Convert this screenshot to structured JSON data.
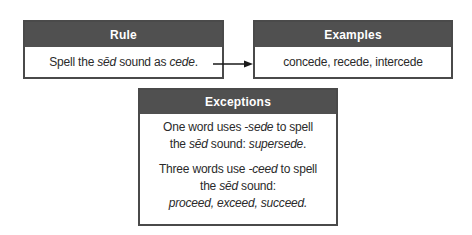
{
  "rule": {
    "title": "Rule",
    "text_pre": "Spell the ",
    "text_sound": "sēd",
    "text_mid": " sound as ",
    "text_word": "cede",
    "text_post": "."
  },
  "examples": {
    "title": "Examples",
    "text": "concede, recede, intercede"
  },
  "exceptions": {
    "title": "Exceptions",
    "p1": {
      "line1_pre": "One word uses ",
      "line1_suffix": "-sede",
      "line1_post": " to spell",
      "line2_pre": "the ",
      "line2_sound": "sēd",
      "line2_mid": " sound: ",
      "line2_word": "supersede",
      "line2_post": "."
    },
    "p2": {
      "line1_pre": "Three words use ",
      "line1_suffix": "-ceed",
      "line1_post": " to spell",
      "line2_pre": "the ",
      "line2_sound": "sēd",
      "line2_post": " sound:",
      "line3": "proceed, exceed, succeed."
    }
  },
  "colors": {
    "header_bg": "#505050",
    "border": "#4a4a4a",
    "header_text": "#ffffff",
    "body_text": "#2a2a2a"
  }
}
